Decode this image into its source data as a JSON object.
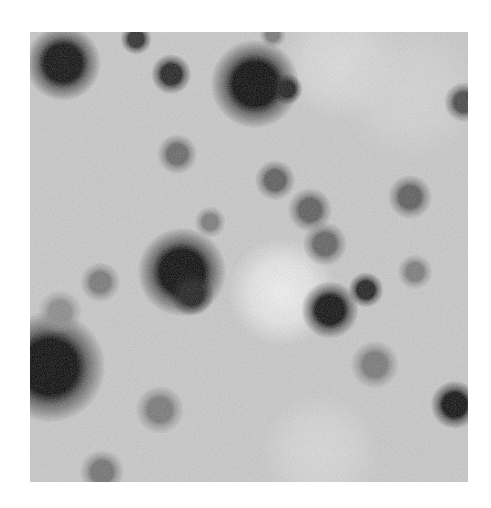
{
  "image": {
    "description": "Inverted grayscale astronomical field: dark stars on light background with bright diffuse patch near center",
    "frame": {
      "left": 30,
      "top": 32,
      "width": 438,
      "height": 450
    },
    "background_color": "#c9c9c9",
    "bright_patches": [
      {
        "x": 252,
        "y": 260,
        "r": 55,
        "color": "#f4f4f4"
      },
      {
        "x": 310,
        "y": 30,
        "r": 60,
        "color": "#dedede"
      },
      {
        "x": 290,
        "y": 420,
        "r": 60,
        "color": "#dadada"
      },
      {
        "x": 380,
        "y": 60,
        "r": 70,
        "color": "#d6d6d6"
      }
    ],
    "stars": [
      {
        "x": 33,
        "y": 31,
        "r": 17,
        "core": "#0a0a0a"
      },
      {
        "x": 106,
        "y": 7,
        "r": 7,
        "core": "#2a2a2a"
      },
      {
        "x": 141,
        "y": 42,
        "r": 9,
        "core": "#1e1e1e"
      },
      {
        "x": 225,
        "y": 52,
        "r": 20,
        "core": "#050505"
      },
      {
        "x": 257,
        "y": 57,
        "r": 7,
        "core": "#1a1a1a"
      },
      {
        "x": 243,
        "y": 3,
        "r": 6,
        "core": "#777777"
      },
      {
        "x": 434,
        "y": 70,
        "r": 9,
        "core": "#444444"
      },
      {
        "x": 147,
        "y": 122,
        "r": 9,
        "core": "#666666"
      },
      {
        "x": 245,
        "y": 148,
        "r": 9,
        "core": "#5a5a5a"
      },
      {
        "x": 280,
        "y": 178,
        "r": 10,
        "core": "#5a5a5a"
      },
      {
        "x": 295,
        "y": 212,
        "r": 10,
        "core": "#606060"
      },
      {
        "x": 380,
        "y": 165,
        "r": 10,
        "core": "#5a5a5a"
      },
      {
        "x": 152,
        "y": 240,
        "r": 20,
        "core": "#050505"
      },
      {
        "x": 162,
        "y": 262,
        "r": 10,
        "core": "#1a1a1a"
      },
      {
        "x": 300,
        "y": 278,
        "r": 13,
        "core": "#0a0a0a"
      },
      {
        "x": 336,
        "y": 258,
        "r": 8,
        "core": "#1a1a1a"
      },
      {
        "x": 20,
        "y": 335,
        "r": 25,
        "core": "#050505"
      },
      {
        "x": 70,
        "y": 250,
        "r": 9,
        "core": "#777777"
      },
      {
        "x": 425,
        "y": 373,
        "r": 11,
        "core": "#0a0a0a"
      },
      {
        "x": 130,
        "y": 378,
        "r": 11,
        "core": "#777777"
      },
      {
        "x": 72,
        "y": 440,
        "r": 10,
        "core": "#707070"
      },
      {
        "x": 345,
        "y": 333,
        "r": 11,
        "core": "#777777"
      },
      {
        "x": 180,
        "y": 190,
        "r": 7,
        "core": "#7a7a7a"
      },
      {
        "x": 385,
        "y": 240,
        "r": 8,
        "core": "#7a7a7a"
      },
      {
        "x": 30,
        "y": 280,
        "r": 10,
        "core": "#8a8a8a"
      }
    ]
  }
}
